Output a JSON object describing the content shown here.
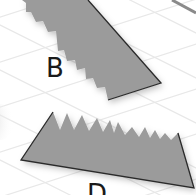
{
  "scene": {
    "background": "#ffffff",
    "grid_color": "#e6e6e6",
    "shape_fill": "#9b9b9b",
    "edge_color": "#2a2a2a"
  },
  "shapes": [
    {
      "id": "B",
      "label": "B"
    },
    {
      "id": "D",
      "label": "D"
    }
  ]
}
